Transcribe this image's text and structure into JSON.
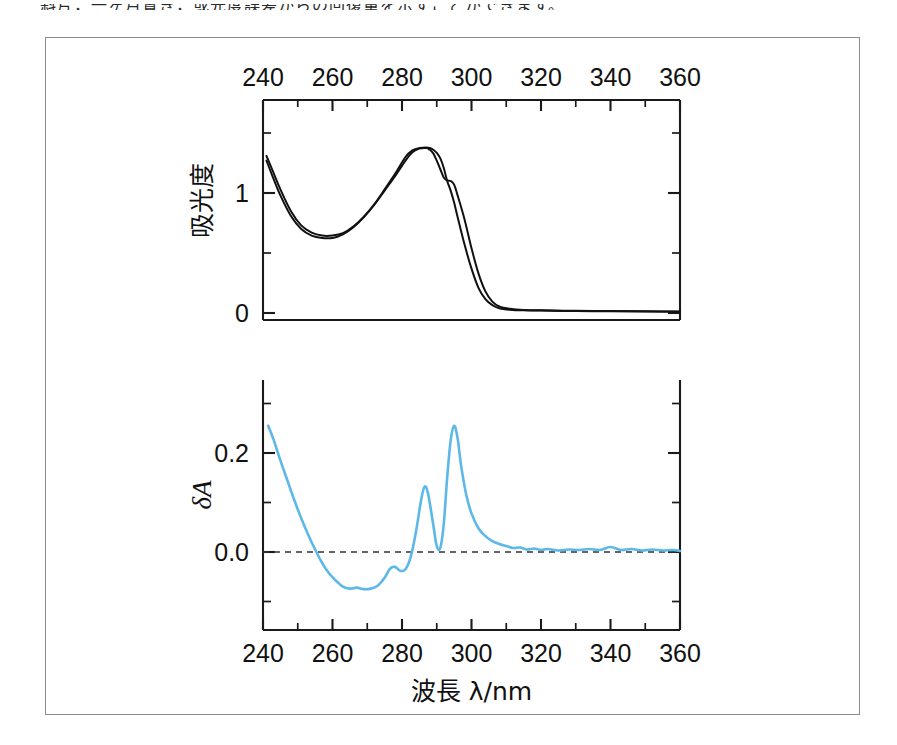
{
  "page": {
    "cut_text_top": "斜片，一ヶ月置き，或光度誤差からの回復量を示すことができます。"
  },
  "figure": {
    "frame_visible": true
  },
  "chart_data": [
    {
      "id": "absorbance-spectrum",
      "type": "line",
      "title": "",
      "xlabel": "",
      "ylabel": "吸光度",
      "xlim": [
        240,
        360
      ],
      "ylim": [
        -0.1,
        1.6
      ],
      "xticks": [
        240,
        260,
        280,
        300,
        320,
        340,
        360
      ],
      "xticklabels": [
        "240",
        "260",
        "280",
        "300",
        "320",
        "340",
        "360"
      ],
      "yticks": [
        0,
        1
      ],
      "yticklabels": [
        "0",
        "1"
      ],
      "yminorticks": [
        0.5,
        1.5
      ],
      "x_axis_position": "top",
      "grid": false,
      "legend": "none",
      "series": [
        {
          "name": "spectrum-curve-1",
          "color": "#111111",
          "x": [
            241,
            243,
            245,
            248,
            251,
            254,
            257,
            260,
            263,
            266,
            269,
            272,
            275,
            278,
            281,
            283,
            285,
            287,
            288,
            289,
            290,
            291,
            292,
            293,
            294,
            295,
            296,
            298,
            300,
            302,
            304,
            306,
            308,
            311,
            315,
            320,
            330,
            340,
            350,
            360
          ],
          "y": [
            1.31,
            1.17,
            1.03,
            0.85,
            0.73,
            0.67,
            0.645,
            0.645,
            0.665,
            0.72,
            0.8,
            0.9,
            1.02,
            1.14,
            1.27,
            1.34,
            1.37,
            1.375,
            1.36,
            1.33,
            1.27,
            1.2,
            1.13,
            1.105,
            1.1,
            1.07,
            0.98,
            0.78,
            0.54,
            0.33,
            0.18,
            0.095,
            0.055,
            0.035,
            0.025,
            0.022,
            0.018,
            0.016,
            0.014,
            0.012
          ]
        },
        {
          "name": "spectrum-curve-2",
          "color": "#111111",
          "x": [
            241,
            243,
            245,
            248,
            251,
            254,
            257,
            260,
            263,
            266,
            269,
            272,
            275,
            278,
            281,
            283,
            285,
            287,
            288,
            289,
            290,
            291,
            292,
            293,
            294,
            295,
            296,
            298,
            300,
            302,
            304,
            306,
            308,
            311,
            315,
            320,
            330,
            340,
            350,
            360
          ],
          "y": [
            1.27,
            1.12,
            0.98,
            0.81,
            0.7,
            0.645,
            0.625,
            0.625,
            0.655,
            0.715,
            0.8,
            0.905,
            1.03,
            1.16,
            1.3,
            1.355,
            1.375,
            1.38,
            1.375,
            1.36,
            1.335,
            1.29,
            1.21,
            1.1,
            1.02,
            0.92,
            0.8,
            0.57,
            0.37,
            0.21,
            0.115,
            0.065,
            0.04,
            0.028,
            0.022,
            0.02,
            0.016,
            0.015,
            0.013,
            0.011
          ]
        }
      ]
    },
    {
      "id": "difference-spectrum",
      "type": "line",
      "title": "",
      "xlabel": "波長 λ/nm",
      "ylabel": "δA",
      "xlim": [
        240,
        360
      ],
      "ylim": [
        -0.12,
        0.3
      ],
      "xticks": [
        240,
        260,
        280,
        300,
        320,
        340,
        360
      ],
      "xticklabels": [
        "240",
        "260",
        "280",
        "300",
        "320",
        "340",
        "360"
      ],
      "yticks": [
        0.0,
        0.2
      ],
      "yticklabels": [
        "0.0",
        "0.2"
      ],
      "yminorticks": [
        -0.1,
        0.1,
        0.3
      ],
      "x_axis_position": "bottom",
      "grid": false,
      "zero_reference_line": true,
      "legend": "none",
      "series": [
        {
          "name": "delta-A-curve",
          "color": "#5bb8e8",
          "x": [
            241.5,
            243,
            245,
            247,
            249,
            251,
            253,
            255,
            257,
            259,
            261,
            263,
            265,
            267,
            269,
            271,
            273,
            275,
            276.5,
            278,
            279.5,
            281,
            282.5,
            284,
            285.5,
            286.5,
            287.5,
            289,
            290,
            291,
            292,
            293,
            294,
            295,
            296,
            297,
            298.5,
            300,
            302,
            304,
            306,
            308,
            310,
            312,
            314,
            316,
            318,
            320,
            322,
            325,
            328,
            331,
            334,
            337,
            340,
            343,
            346,
            349,
            352,
            355,
            358,
            360
          ],
          "y": [
            0.255,
            0.228,
            0.185,
            0.145,
            0.105,
            0.068,
            0.035,
            0.005,
            -0.022,
            -0.043,
            -0.058,
            -0.07,
            -0.074,
            -0.072,
            -0.075,
            -0.074,
            -0.068,
            -0.052,
            -0.034,
            -0.03,
            -0.038,
            -0.035,
            -0.01,
            0.04,
            0.105,
            0.132,
            0.118,
            0.055,
            0.012,
            0.008,
            0.055,
            0.15,
            0.225,
            0.255,
            0.23,
            0.175,
            0.115,
            0.078,
            0.048,
            0.032,
            0.022,
            0.016,
            0.012,
            0.008,
            0.009,
            0.005,
            0.007,
            0.004,
            0.006,
            0.003,
            0.005,
            0.004,
            0.006,
            0.004,
            0.01,
            0.004,
            0.006,
            0.003,
            0.005,
            0.003,
            0.004,
            0.002
          ]
        }
      ]
    }
  ]
}
